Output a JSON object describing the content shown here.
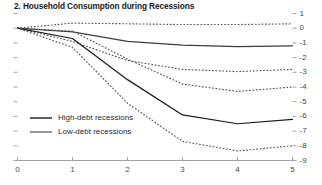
{
  "chart_data": {
    "type": "line",
    "title": "2. Household Consumption during Recessions",
    "xlabel": "",
    "ylabel": "",
    "xlim": [
      0,
      5
    ],
    "ylim": [
      -9,
      1
    ],
    "grid": false,
    "legend_position": "center-left",
    "x": [
      0,
      1,
      2,
      3,
      4,
      5
    ],
    "xticks": [
      "0",
      "1",
      "2",
      "3",
      "4",
      "5"
    ],
    "yticks": [
      "1",
      "0",
      "-1",
      "-2",
      "-3",
      "-4",
      "-5",
      "-6",
      "-7",
      "-8",
      "-9"
    ],
    "yaxis_side": "right",
    "series": [
      {
        "name": "Low-debt recessions",
        "style": "solid",
        "color": "#3c3c3c",
        "values": [
          0.0,
          -0.25,
          -0.9,
          -1.15,
          -1.25,
          -1.2
        ]
      },
      {
        "name": "Low-debt recessions upper band",
        "style": "dotted",
        "color": "#555555",
        "values": [
          0.0,
          0.35,
          0.3,
          0.25,
          0.25,
          0.3
        ]
      },
      {
        "name": "Low-debt recessions lower band",
        "style": "dotted",
        "color": "#555555",
        "values": [
          0.0,
          -0.9,
          -2.2,
          -2.8,
          -2.95,
          -2.8
        ]
      },
      {
        "name": "High-debt recessions",
        "style": "solid",
        "color": "#1a1a1a",
        "values": [
          0.0,
          -0.7,
          -3.5,
          -5.9,
          -6.5,
          -6.2
        ]
      },
      {
        "name": "High-debt recessions upper band",
        "style": "dotted",
        "color": "#555555",
        "values": [
          0.0,
          -0.2,
          -2.1,
          -3.8,
          -4.3,
          -4.0
        ]
      },
      {
        "name": "High-debt recessions lower band",
        "style": "dotted",
        "color": "#555555",
        "values": [
          0.0,
          -1.3,
          -5.1,
          -7.7,
          -8.35,
          -8.0
        ]
      }
    ],
    "legend": [
      {
        "label": "High-debt recessions",
        "style": "solid",
        "color": "#1a1a1a"
      },
      {
        "label": "Low-debt recessions",
        "style": "solid",
        "color": "#6a6a6a"
      }
    ]
  }
}
